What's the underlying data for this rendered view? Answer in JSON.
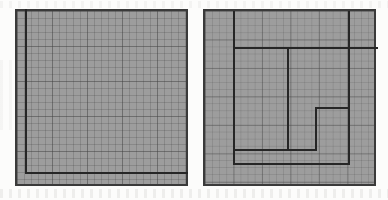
{
  "figure": {
    "background_color": "#fcfcfb",
    "grid_fill_color": "#9d9d9d",
    "grid_line_color": "#464646",
    "heavy_line_color": "#262626",
    "outer_border_color": "#3a3a3a"
  },
  "panels": [
    {
      "id": "left",
      "name": "fine-grid-square",
      "label": "Left square",
      "x": 15,
      "y": 9,
      "width": 173,
      "height": 177,
      "grid_type": "fine",
      "minor_cell_px": 7,
      "major_cell_px": 35,
      "minor_cells_across": 24,
      "minor_cells_down": 25,
      "overlay": {
        "name": "inset-rectangle",
        "kind": "open-rectangle",
        "inset_left_px": 8,
        "inset_bottom_px": 10,
        "stroke_px": 2,
        "sides_drawn": [
          "left",
          "bottom"
        ]
      }
    },
    {
      "id": "right",
      "name": "partitioned-square",
      "label": "Right square",
      "x": 203,
      "y": 9,
      "width": 173,
      "height": 177,
      "grid_type": "coarse",
      "minor_cell_px": 7,
      "major_cell_px": 28,
      "major_cells_across": 6,
      "major_cells_down": 6,
      "partition_segments": [
        {
          "name": "vertical-left-partition",
          "orientation": "vertical",
          "x": 28,
          "y": 0,
          "length": 152
        },
        {
          "name": "horizontal-upper-partition",
          "orientation": "horizontal",
          "x": 28,
          "y": 36,
          "length": 116
        },
        {
          "name": "vertical-right-partition",
          "orientation": "vertical",
          "x": 143,
          "y": 0,
          "length": 152
        },
        {
          "name": "horizontal-right-stub",
          "orientation": "horizontal",
          "x": 143,
          "y": 36,
          "length": 30
        },
        {
          "name": "vertical-center-partition",
          "orientation": "vertical",
          "x": 82,
          "y": 36,
          "length": 104
        },
        {
          "name": "step-horizontal-upper",
          "orientation": "horizontal",
          "x": 110,
          "y": 96,
          "length": 35
        },
        {
          "name": "step-vertical",
          "orientation": "vertical",
          "x": 110,
          "y": 96,
          "length": 44
        },
        {
          "name": "step-horizontal-lower",
          "orientation": "horizontal",
          "x": 82,
          "y": 138,
          "length": 30
        },
        {
          "name": "horizontal-lower-partition",
          "orientation": "horizontal",
          "x": 28,
          "y": 138,
          "length": 56
        },
        {
          "name": "horizontal-bottom-partition",
          "orientation": "horizontal",
          "x": 28,
          "y": 152,
          "length": 117
        }
      ]
    }
  ]
}
